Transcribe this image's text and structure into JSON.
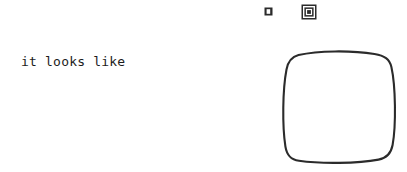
{
  "canvas": {
    "width": 407,
    "height": 172,
    "background_color": "#ffffff"
  },
  "caption": {
    "text": "it looks like",
    "color": "#1c1c1c"
  },
  "icons": [
    {
      "name": "small-filled-square-icon",
      "label": "small square",
      "color": "#2b2b2b"
    },
    {
      "name": "nested-square-icon",
      "label": "nested squares",
      "color": "#2b2b2b"
    }
  ],
  "shape": {
    "name": "hand-drawn-rounded-square",
    "label": "rounded square",
    "stroke_color": "#2b2b2b",
    "fill": "none"
  }
}
